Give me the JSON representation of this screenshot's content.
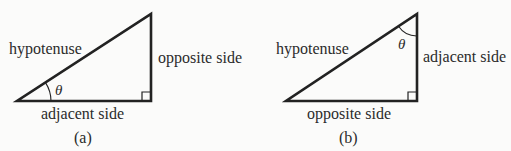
{
  "colors": {
    "background": "#fbfbfa",
    "line": "#222222",
    "text": "#2b2b2b"
  },
  "figures": [
    {
      "id": "a",
      "caption": "(a)",
      "angle_label": "θ",
      "angle_position": "bottom-left vertex",
      "labels": {
        "hypotenuse": "hypotenuse",
        "vertical_side": "opposite side",
        "horizontal_side": "adjacent side"
      }
    },
    {
      "id": "b",
      "caption": "(b)",
      "angle_label": "θ",
      "angle_position": "top-right vertex",
      "labels": {
        "hypotenuse": "hypotenuse",
        "vertical_side": "adjacent side",
        "horizontal_side": "opposite side"
      }
    }
  ]
}
